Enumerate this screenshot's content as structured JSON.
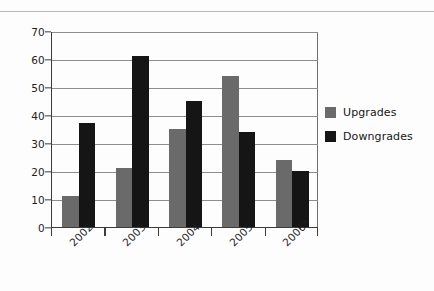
{
  "chart_data": {
    "type": "bar",
    "title": "",
    "subtitle": "",
    "xlabel": "",
    "ylabel": "",
    "categories": [
      "2002",
      "2003",
      "2004",
      "2005",
      "2006*"
    ],
    "series": [
      {
        "name": "Upgrades",
        "color": "#6a6a6a",
        "values": [
          11,
          21,
          35,
          54,
          24
        ]
      },
      {
        "name": "Downgrades",
        "color": "#151515",
        "values": [
          37,
          61,
          45,
          34,
          20
        ]
      }
    ],
    "ylim": [
      0,
      70
    ],
    "yticks": [
      0,
      10,
      20,
      30,
      40,
      50,
      60,
      70
    ],
    "ytick_labels": [
      "0",
      "10",
      "20",
      "30",
      "40",
      "50",
      "60",
      "70"
    ],
    "grid": true,
    "grid_axis": "y",
    "legend_position": "right",
    "legend_entries": [
      "Upgrades",
      "Downgrades"
    ],
    "xtick_rotation": -45,
    "annotations": []
  },
  "legend": {
    "items": [
      {
        "label": "Upgrades",
        "swatch": "upgrades-swatch"
      },
      {
        "label": "Downgrades",
        "swatch": "downgrades-swatch"
      }
    ]
  },
  "colors": {
    "upgrades": "#6a6a6a",
    "downgrades": "#151515",
    "axis": "#3b3b3b",
    "gridline": "#8d8d8d",
    "background": "#fdfdfd",
    "top_rule": "#b9b9b9"
  }
}
